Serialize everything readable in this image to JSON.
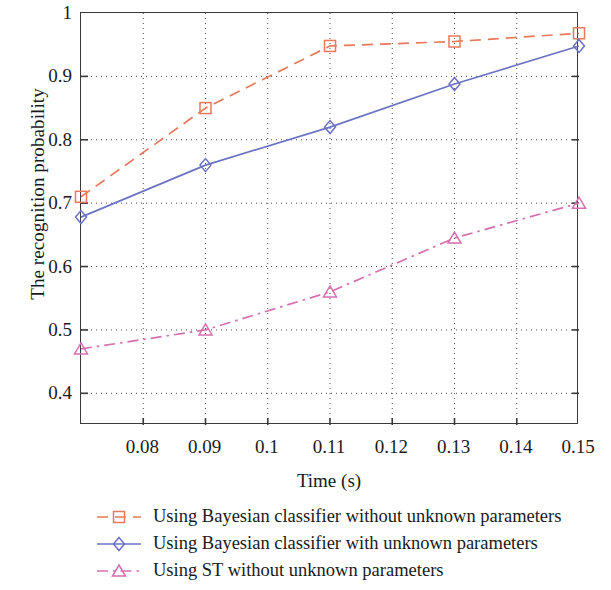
{
  "chart_data": {
    "type": "line",
    "title": "",
    "xlabel": "Time (s)",
    "ylabel": "The recognition probability",
    "xlim": [
      0.07,
      0.15
    ],
    "ylim": [
      0.35,
      1.0
    ],
    "xticks": [
      0.08,
      0.09,
      0.1,
      0.11,
      0.12,
      0.13,
      0.14,
      0.15
    ],
    "xticklabels": [
      "0.08",
      "0.09",
      "0.1",
      "0.11",
      "0.12",
      "0.13",
      "0.14",
      "0.15"
    ],
    "yticks": [
      0.4,
      0.5,
      0.6,
      0.7,
      0.8,
      0.9,
      1
    ],
    "yticklabels": [
      "0.4",
      "0.5",
      "0.6",
      "0.7",
      "0.8",
      "0.9",
      "1"
    ],
    "grid": true,
    "grid_style": "dotted",
    "legend_position": "below",
    "x": [
      0.07,
      0.09,
      0.11,
      0.13,
      0.15
    ],
    "series": [
      {
        "name": "Using Bayesian classifier without unknown parameters",
        "values": [
          0.71,
          0.85,
          0.948,
          0.955,
          0.968
        ],
        "color": "#e8795a",
        "linestyle": "dashed",
        "marker": "square"
      },
      {
        "name": "Using Bayesian classifier with unknown parameters",
        "values": [
          0.678,
          0.76,
          0.82,
          0.888,
          0.948
        ],
        "color": "#6b73c4",
        "linestyle": "solid",
        "marker": "diamond"
      },
      {
        "name": "Using ST without unknown parameters",
        "values": [
          0.47,
          0.5,
          0.56,
          0.645,
          0.7
        ],
        "color": "#d66fb0",
        "linestyle": "dashdot",
        "marker": "triangle"
      }
    ]
  },
  "axis": {
    "ylabel_text": "The recognition probability",
    "xlabel_text": "Time (s)"
  },
  "legend": {
    "items": [
      {
        "label": "Using Bayesian classifier without unknown parameters"
      },
      {
        "label": "Using Bayesian classifier with unknown parameters"
      },
      {
        "label": "Using ST without unknown parameters"
      }
    ]
  }
}
